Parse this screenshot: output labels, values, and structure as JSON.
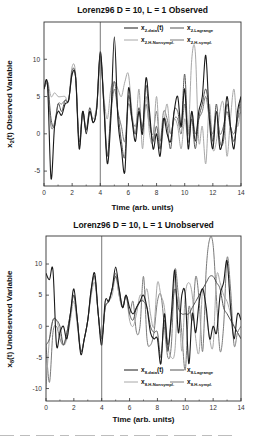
{
  "chart_data": [
    {
      "type": "line",
      "title": "Lorenz96  D = 10, L = 1  Observed",
      "xlabel": "Time   (arb. units)",
      "ylabel": "x₂(t)   Observed Variable",
      "ylabel_main": "x",
      "ylabel_sub": "2",
      "ylabel_rest": "(t)   Observed Variable",
      "xlim": [
        0,
        14
      ],
      "ylim": [
        -7,
        15
      ],
      "xticks": [
        0,
        2,
        4,
        6,
        8,
        10,
        12,
        14
      ],
      "yticks": [
        -5,
        0,
        5,
        10
      ],
      "vline_x": 4,
      "grid": false,
      "legend_position": "upper right, inside",
      "legend": [
        {
          "main": "x",
          "sub": "2-data",
          "suffix": "(t)"
        },
        {
          "main": "x",
          "sub": "2-Lagrange",
          "suffix": ""
        },
        {
          "main": "x",
          "sub": "2-H-Nonsympl.",
          "suffix": ""
        },
        {
          "main": "x",
          "sub": "2-H-sympl.",
          "suffix": ""
        }
      ],
      "x": [
        0,
        0.25,
        0.5,
        0.75,
        1,
        1.25,
        1.5,
        1.75,
        2,
        2.25,
        2.5,
        2.75,
        3,
        3.25,
        3.5,
        3.75,
        4,
        4.25,
        4.5,
        4.75,
        5,
        5.25,
        5.5,
        5.75,
        6,
        6.25,
        6.5,
        6.75,
        7,
        7.25,
        7.5,
        7.75,
        8,
        8.25,
        8.5,
        8.75,
        9,
        9.25,
        9.5,
        9.75,
        10,
        10.25,
        10.5,
        10.75,
        11,
        11.25,
        11.5,
        11.75,
        12,
        12.25,
        12.5,
        12.75,
        13,
        13.25,
        13.5,
        13.75,
        14
      ],
      "series": [
        {
          "name": "x2-data(t)",
          "color": "#1a1a1a",
          "width": 1.1,
          "values": [
            6,
            6.5,
            -6,
            1,
            3,
            2.5,
            4,
            4.5,
            8,
            7.5,
            -2,
            3,
            0,
            3,
            1.5,
            3.5,
            11,
            4,
            -4,
            2,
            13,
            2,
            -2,
            -5,
            6,
            2,
            -1,
            3,
            0,
            7.5,
            3,
            -2,
            0,
            -3,
            2,
            0,
            -1,
            3,
            5,
            1,
            6,
            -2,
            3,
            -1,
            3,
            5,
            10.5,
            2,
            -2,
            3,
            -2,
            0,
            5,
            1,
            -2,
            3,
            5
          ]
        },
        {
          "name": "x2-Lagrange",
          "color": "#555555",
          "width": 1.0,
          "values": [
            6,
            7,
            2,
            1,
            4,
            3,
            4.5,
            4.5,
            8.5,
            7.5,
            -1,
            3,
            0.5,
            3.5,
            1.5,
            3.5,
            10.5,
            4,
            -3,
            3,
            7,
            3,
            -1,
            -3,
            5,
            2,
            0,
            3.5,
            0.5,
            6.5,
            2,
            -1,
            1,
            -2,
            2,
            1,
            -2,
            3,
            3,
            1,
            8,
            -1,
            2,
            -2,
            2,
            4,
            6,
            3,
            -1,
            4,
            -1,
            -1,
            4,
            1,
            -1,
            2,
            5
          ]
        },
        {
          "name": "x2-H-Nonsympl.",
          "color": "#a8a8a8",
          "width": 1.0,
          "values": [
            6,
            7,
            5,
            5.5,
            5,
            5,
            5,
            4.5,
            9,
            8,
            -1.5,
            2.5,
            0.5,
            3,
            2,
            4,
            10,
            5,
            2,
            6,
            7,
            6,
            5,
            7,
            8,
            3,
            0,
            6,
            -2,
            5,
            0,
            -1,
            5,
            -2,
            1,
            4,
            0,
            2,
            1,
            -2,
            2,
            0,
            10,
            11,
            -1,
            1,
            -4,
            4,
            -2,
            -1,
            3,
            4,
            -3,
            2,
            6,
            1,
            4
          ]
        },
        {
          "name": "x2-H-sympl.",
          "color": "#7a7a7a",
          "width": 1.0,
          "values": [
            6,
            6.5,
            1,
            1.5,
            4,
            4,
            4.5,
            4.5,
            8,
            7.5,
            -1.5,
            3,
            0.5,
            3,
            1.5,
            3.5,
            10.8,
            4.5,
            -3,
            2.5,
            6,
            3,
            1,
            -1,
            4,
            2,
            1,
            3,
            1,
            4,
            1,
            0,
            3,
            -1,
            3,
            2,
            0,
            2,
            2,
            0,
            4,
            0,
            3,
            0,
            2,
            3,
            5,
            2,
            0,
            3,
            0,
            1,
            3,
            1,
            0,
            2,
            3
          ]
        }
      ]
    },
    {
      "type": "line",
      "title": "Lorenz96  D = 10, L = 1  Unobserved",
      "xlabel": "Time   (arb. units)",
      "ylabel": "x₈(t)   Unobserved Variable",
      "ylabel_main": "x",
      "ylabel_sub": "8",
      "ylabel_rest": "(t)   Unobserved Variable",
      "xlim": [
        0,
        14
      ],
      "ylim": [
        -12,
        14.5
      ],
      "xticks": [
        0,
        2,
        4,
        6,
        8,
        10,
        12,
        14
      ],
      "yticks": [
        -10,
        -5,
        0,
        5,
        10
      ],
      "vline_x": 4,
      "grid": false,
      "legend_position": "lower right, inside",
      "legend": [
        {
          "main": "x",
          "sub": "8-data",
          "suffix": "(t)"
        },
        {
          "main": "x",
          "sub": "8-Lagrange",
          "suffix": ""
        },
        {
          "main": "x",
          "sub": "8-H-Nonsympl.",
          "suffix": ""
        },
        {
          "main": "x",
          "sub": "8-H-sympl.",
          "suffix": ""
        }
      ],
      "x": [
        0,
        0.25,
        0.5,
        0.75,
        1,
        1.25,
        1.5,
        1.75,
        2,
        2.25,
        2.5,
        2.75,
        3,
        3.25,
        3.5,
        3.75,
        4,
        4.25,
        4.5,
        4.75,
        5,
        5.25,
        5.5,
        5.75,
        6,
        6.25,
        6.5,
        6.75,
        7,
        7.25,
        7.5,
        7.75,
        8,
        8.25,
        8.5,
        8.75,
        9,
        9.25,
        9.5,
        9.75,
        10,
        10.25,
        10.5,
        10.75,
        11,
        11.25,
        11.5,
        11.75,
        12,
        12.25,
        12.5,
        12.75,
        13,
        13.25,
        13.5,
        13.75,
        14
      ],
      "series": [
        {
          "name": "x8-data(t)",
          "color": "#1a1a1a",
          "width": 1.1,
          "values": [
            8.5,
            7.5,
            9,
            -3,
            -1,
            0,
            -2,
            2,
            6,
            1,
            -4.5,
            -2,
            1,
            6,
            8.5,
            2,
            -3,
            4,
            4,
            6,
            9.5,
            6,
            3,
            5,
            3,
            2,
            3,
            4,
            5,
            3,
            -1,
            -2,
            -2,
            -6,
            2,
            -4,
            2,
            9,
            -1,
            5,
            5,
            -6,
            2,
            -1,
            4,
            6,
            3,
            -2,
            0,
            -1,
            5,
            7,
            10.5,
            3,
            -2,
            2,
            1
          ]
        },
        {
          "name": "x8-Lagrange",
          "color": "#555555",
          "width": 1.0,
          "values": [
            -3,
            -2,
            1,
            1,
            0,
            -3,
            -1,
            2,
            5,
            1,
            -4,
            -2,
            1,
            6,
            8,
            2,
            -2,
            3,
            4,
            6,
            8,
            6,
            3,
            5,
            2,
            1,
            3,
            4,
            4,
            3,
            0,
            -1,
            -1,
            -5,
            1,
            -3,
            1,
            6,
            3,
            2,
            2,
            2,
            3,
            4,
            5,
            6,
            7,
            8,
            8,
            7,
            6,
            3,
            2,
            1,
            0,
            -1,
            -2
          ]
        },
        {
          "name": "x8-H-Nonsympl.",
          "color": "#a8a8a8",
          "width": 1.0,
          "values": [
            -10,
            -2,
            1,
            1,
            -1,
            -3,
            -2,
            1,
            4,
            0,
            -4,
            -2,
            1,
            5,
            7,
            2,
            -2,
            3,
            4,
            5,
            8,
            5,
            3,
            5,
            1,
            0,
            2,
            5,
            4,
            6,
            2,
            0,
            7,
            5,
            3,
            -3,
            -5,
            -4,
            5,
            -4,
            5,
            7,
            5,
            -2,
            -4,
            6,
            2,
            -2,
            -3,
            8,
            7,
            5,
            4,
            2,
            0,
            -1,
            -2
          ]
        },
        {
          "name": "x8-H-sympl.",
          "color": "#7a7a7a",
          "width": 1.0,
          "values": [
            -3,
            -9,
            -1,
            0,
            -2,
            -3,
            -1,
            2,
            5,
            1,
            -4,
            -2,
            1,
            5.5,
            8,
            2,
            -2,
            3,
            4,
            6,
            8.5,
            5,
            3,
            5,
            2,
            4,
            -1,
            0,
            8,
            -2,
            -3,
            -1,
            4,
            5,
            0,
            -5,
            -3,
            9,
            5,
            -1,
            -7,
            3,
            1,
            8,
            4,
            -4,
            9,
            14,
            13,
            4,
            -4,
            0,
            11,
            6,
            -3,
            -1,
            0
          ]
        }
      ]
    }
  ],
  "caption_fragment": "(cut-off caption text, illegible)"
}
